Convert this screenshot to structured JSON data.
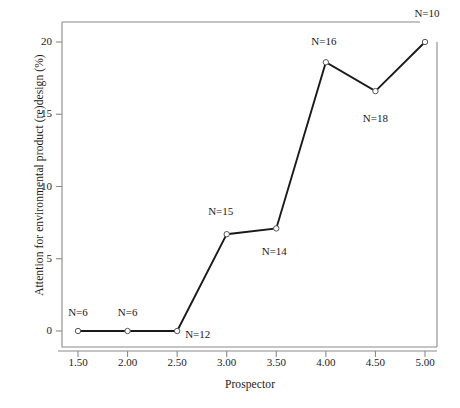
{
  "chart_data": {
    "type": "line",
    "title": "",
    "xlabel": "Prospector",
    "ylabel": "Attention for environmental product (re)design (%)",
    "x": [
      1.5,
      2.0,
      2.5,
      3.0,
      3.5,
      4.0,
      4.5,
      5.0
    ],
    "values": [
      0.0,
      0.0,
      0.0,
      6.7,
      7.1,
      18.6,
      16.6,
      20.0
    ],
    "point_labels": [
      "N=6",
      "N=6",
      "N=12",
      "N=15",
      "N=14",
      "N=16",
      "N=18",
      "N=10"
    ],
    "xtick_labels": [
      "1.50",
      "2.00",
      "2.50",
      "3.00",
      "3.50",
      "4.00",
      "4.50",
      "5.00"
    ],
    "xticks": [
      1.5,
      2.0,
      2.5,
      3.0,
      3.5,
      4.0,
      4.5,
      5.0
    ],
    "ytick_labels": [
      "0",
      "5",
      "10",
      "15",
      "20"
    ],
    "yticks": [
      0,
      5,
      10,
      15,
      20
    ],
    "xlim": [
      1.28,
      5.22
    ],
    "ylim": [
      -0.6,
      21.2
    ],
    "grid": false,
    "legend": false,
    "marker": "open-circle",
    "line_color": "#1a1a1a",
    "marker_face_color": "#ffffff",
    "marker_edge_color": "#555555",
    "frame_color": "#8a8a8a",
    "annotation_offsets": [
      {
        "dx": 0,
        "dy": -18,
        "align": "center"
      },
      {
        "dx": 0,
        "dy": -18,
        "align": "center"
      },
      {
        "dx": 8,
        "dy": 4,
        "align": "left"
      },
      {
        "dx": -6,
        "dy": -22,
        "align": "center"
      },
      {
        "dx": -2,
        "dy": 24,
        "align": "center"
      },
      {
        "dx": -2,
        "dy": -20,
        "align": "center"
      },
      {
        "dx": 0,
        "dy": 28,
        "align": "center"
      },
      {
        "dx": 2,
        "dy": -28,
        "align": "center"
      }
    ]
  }
}
